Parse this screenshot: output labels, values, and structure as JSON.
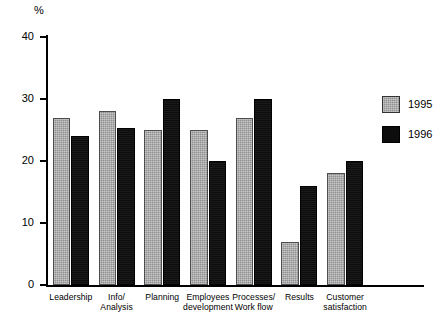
{
  "chart_data": {
    "type": "bar",
    "title": "",
    "xlabel": "",
    "ylabel": "%",
    "ylim": [
      0,
      40
    ],
    "yticks": [
      0,
      10,
      20,
      30,
      40
    ],
    "grid": false,
    "legend_position": "right",
    "categories": [
      "Leadership",
      "Info/\nAnalysis",
      "Planning",
      "Employees\ndevelopment",
      "Processes/\nWork flow",
      "Results",
      "Customer\nsatisfaction"
    ],
    "series": [
      {
        "name": "1995",
        "color": "#8f8f8f",
        "values": [
          27,
          28,
          25,
          25,
          27,
          7,
          18
        ]
      },
      {
        "name": "1996",
        "color": "#0d0d0d",
        "values": [
          24,
          25.3,
          30,
          20,
          30,
          16,
          20
        ]
      }
    ]
  },
  "axis": {
    "unit_label": "%",
    "tick_labels": [
      "40",
      "30",
      "20",
      "10",
      "0"
    ]
  },
  "categories": {
    "c0": {
      "line1": "Leadership",
      "line2": ""
    },
    "c1": {
      "line1": "Info/",
      "line2": "Analysis"
    },
    "c2": {
      "line1": "Planning",
      "line2": ""
    },
    "c3": {
      "line1": "Employees",
      "line2": "development"
    },
    "c4": {
      "line1": "Processes/",
      "line2": "Work flow"
    },
    "c5": {
      "line1": "Results",
      "line2": ""
    },
    "c6": {
      "line1": "Customer",
      "line2": "satisfaction"
    }
  },
  "legend": {
    "items": [
      {
        "label": "1995"
      },
      {
        "label": "1996"
      }
    ]
  }
}
